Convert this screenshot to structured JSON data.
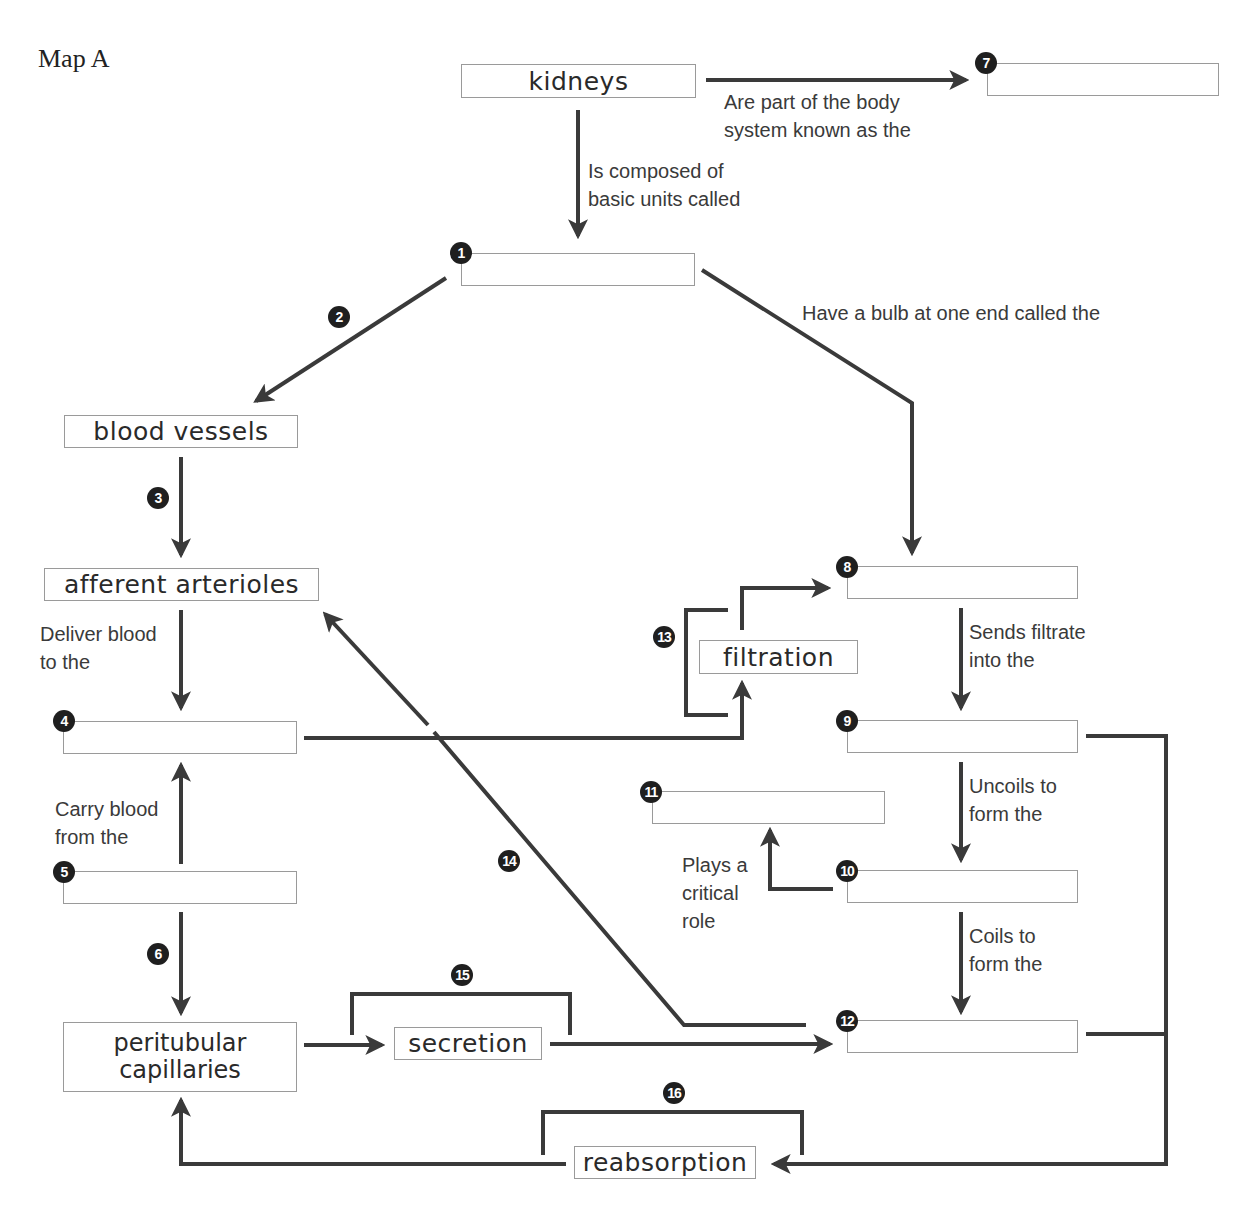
{
  "title": "Map A",
  "concepts": {
    "kidneys": "kidneys",
    "blood_vessels": "blood vessels",
    "afferent_arterioles": "afferent arterioles",
    "filtration": "filtration",
    "peritubular_capillaries": "peritubular\ncapillaries",
    "secretion": "secretion",
    "reabsorption": "reabsorption"
  },
  "blanks": [
    {
      "number": "1",
      "value": ""
    },
    {
      "number": "4",
      "value": ""
    },
    {
      "number": "5",
      "value": ""
    },
    {
      "number": "7",
      "value": ""
    },
    {
      "number": "8",
      "value": ""
    },
    {
      "number": "9",
      "value": ""
    },
    {
      "number": "10",
      "value": ""
    },
    {
      "number": "11",
      "value": ""
    },
    {
      "number": "12",
      "value": ""
    }
  ],
  "link_numbers": {
    "n2": "2",
    "n3": "3",
    "n6": "6",
    "n13": "13",
    "n14": "14",
    "n15": "15",
    "n16": "16"
  },
  "linking_phrases": {
    "body_system": "Are part of the body\nsystem known as the",
    "composed_of": "Is composed of\nbasic units called",
    "bulb": "Have a bulb at one end called the",
    "deliver_blood": "Deliver blood\nto the",
    "carry_blood": "Carry blood\nfrom the",
    "sends_filtrate": "Sends filtrate\ninto the",
    "uncoils": "Uncoils to\nform the",
    "plays_role": "Plays a\ncritical\nrole",
    "coils": "Coils to\nform the"
  },
  "colors": {
    "line": "#3a3a3a",
    "box_border": "#9a9a9a",
    "badge": "#1f1f1f"
  }
}
